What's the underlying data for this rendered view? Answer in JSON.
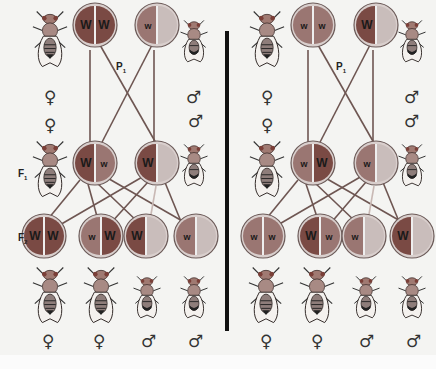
{
  "colors": {
    "background": "#f4f4f2",
    "dominant_W": "#7a4a44",
    "recessive_w": "#9a7672",
    "y_chromosome": "#c9bdbb",
    "ring": "#d9cfcd",
    "outline": "#6b5a58",
    "lines": "#6e5652",
    "divider": "#111111"
  },
  "labels": {
    "p1": "P",
    "p1_sub": "1",
    "f1": "F",
    "f1_sub": "1",
    "f2": "F",
    "f2_sub": "2"
  },
  "symbols": {
    "female": "♀",
    "male": "♂"
  },
  "panels": [
    {
      "name": "cross-red-female",
      "p1": [
        {
          "sex": "female",
          "left": {
            "allele": "W",
            "type": "W"
          },
          "right": {
            "allele": "W",
            "type": "W"
          }
        },
        {
          "sex": "male",
          "left": {
            "allele": "w",
            "type": "w"
          },
          "right": {
            "allele": "",
            "type": "Y"
          }
        }
      ],
      "f1": [
        {
          "sex": "female",
          "left": {
            "allele": "W",
            "type": "W"
          },
          "right": {
            "allele": "w",
            "type": "w"
          }
        },
        {
          "sex": "male",
          "left": {
            "allele": "W",
            "type": "W"
          },
          "right": {
            "allele": "",
            "type": "Y"
          }
        }
      ],
      "f2": [
        {
          "sex": "female",
          "left": {
            "allele": "W",
            "type": "W"
          },
          "right": {
            "allele": "W",
            "type": "W"
          }
        },
        {
          "sex": "female",
          "left": {
            "allele": "w",
            "type": "w"
          },
          "right": {
            "allele": "W",
            "type": "W"
          }
        },
        {
          "sex": "male",
          "left": {
            "allele": "W",
            "type": "W"
          },
          "right": {
            "allele": "",
            "type": "Y"
          }
        },
        {
          "sex": "male",
          "left": {
            "allele": "w",
            "type": "w"
          },
          "right": {
            "allele": "",
            "type": "Y"
          }
        }
      ]
    },
    {
      "name": "cross-white-female",
      "p1": [
        {
          "sex": "female",
          "left": {
            "allele": "w",
            "type": "w"
          },
          "right": {
            "allele": "w",
            "type": "w"
          }
        },
        {
          "sex": "male",
          "left": {
            "allele": "W",
            "type": "W"
          },
          "right": {
            "allele": "",
            "type": "Y"
          }
        }
      ],
      "f1": [
        {
          "sex": "female",
          "left": {
            "allele": "w",
            "type": "w"
          },
          "right": {
            "allele": "W",
            "type": "W"
          }
        },
        {
          "sex": "male",
          "left": {
            "allele": "w",
            "type": "w"
          },
          "right": {
            "allele": "",
            "type": "Y"
          }
        }
      ],
      "f2": [
        {
          "sex": "female",
          "left": {
            "allele": "w",
            "type": "w"
          },
          "right": {
            "allele": "w",
            "type": "w"
          }
        },
        {
          "sex": "female",
          "left": {
            "allele": "W",
            "type": "W"
          },
          "right": {
            "allele": "w",
            "type": "w"
          }
        },
        {
          "sex": "male",
          "left": {
            "allele": "w",
            "type": "w"
          },
          "right": {
            "allele": "",
            "type": "Y"
          }
        },
        {
          "sex": "male",
          "left": {
            "allele": "W",
            "type": "W"
          },
          "right": {
            "allele": "",
            "type": "Y"
          }
        }
      ]
    }
  ],
  "flies": {
    "top_row": [
      "female",
      "male",
      "female",
      "male"
    ],
    "f1_row": [
      "female",
      "male",
      "female",
      "male"
    ],
    "bottom_row": [
      "female",
      "female",
      "male",
      "male",
      "female",
      "female",
      "male",
      "male"
    ],
    "bottom_symbols": [
      "♀",
      "♀",
      "♂",
      "♂",
      "♀",
      "♀",
      "♂",
      "♂"
    ]
  }
}
